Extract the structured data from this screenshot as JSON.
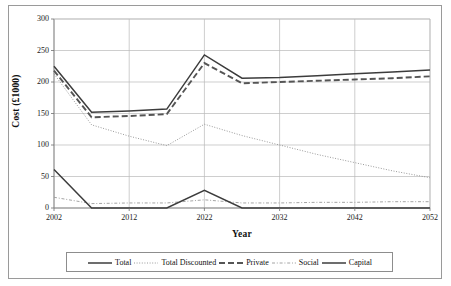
{
  "chart_data": {
    "type": "line",
    "title": "",
    "xlabel": "Year",
    "ylabel": "Cost (£1000)",
    "xlim": [
      2002,
      2052
    ],
    "ylim": [
      0,
      300
    ],
    "xticks": [
      2002,
      2012,
      2022,
      2032,
      2042,
      2052
    ],
    "yticks": [
      0,
      50,
      100,
      150,
      200,
      250,
      300
    ],
    "grid": true,
    "legend_position": "bottom",
    "x": [
      2002,
      2007,
      2012,
      2017,
      2022,
      2027,
      2032,
      2037,
      2042,
      2047,
      2052
    ],
    "series": [
      {
        "name": "Total",
        "style": "solid",
        "color": "#3c3c3c",
        "values": [
          225,
          152,
          154,
          157,
          243,
          206,
          207,
          210,
          213,
          216,
          219
        ]
      },
      {
        "name": "Total Discounted",
        "style": "dotted",
        "color": "#8f8f8f",
        "values": [
          213,
          132,
          114,
          99,
          133,
          115,
          100,
          85,
          72,
          59,
          48
        ]
      },
      {
        "name": "Private",
        "style": "dashed",
        "color": "#555555",
        "values": [
          218,
          144,
          146,
          149,
          230,
          198,
          200,
          202,
          204,
          206,
          209
        ]
      },
      {
        "name": "Social",
        "style": "dashdot",
        "color": "#9a9a9a",
        "values": [
          17,
          7,
          8,
          8,
          13,
          8,
          8,
          9,
          9,
          10,
          10
        ]
      },
      {
        "name": "Capital",
        "style": "solid",
        "color": "#3c3c3c",
        "values": [
          61,
          0,
          0,
          0,
          28,
          0,
          0,
          0,
          0,
          0,
          0
        ]
      }
    ]
  },
  "axes": {
    "y_title": "Cost (£1000)",
    "x_title": "Year",
    "y_tick_labels": [
      "300",
      "250",
      "200",
      "150",
      "100",
      "50",
      "0"
    ],
    "x_tick_labels": [
      "2002",
      "2012",
      "2022",
      "2032",
      "2042",
      "2052"
    ]
  },
  "legend": {
    "items": [
      {
        "label": "Total",
        "icon": "solid-line-icon"
      },
      {
        "label": "Total Discounted",
        "icon": "dotted-line-icon"
      },
      {
        "label": "Private",
        "icon": "dashed-line-icon"
      },
      {
        "label": "Social",
        "icon": "dashdot-line-icon"
      },
      {
        "label": "Capital",
        "icon": "solid-line-icon"
      }
    ]
  }
}
